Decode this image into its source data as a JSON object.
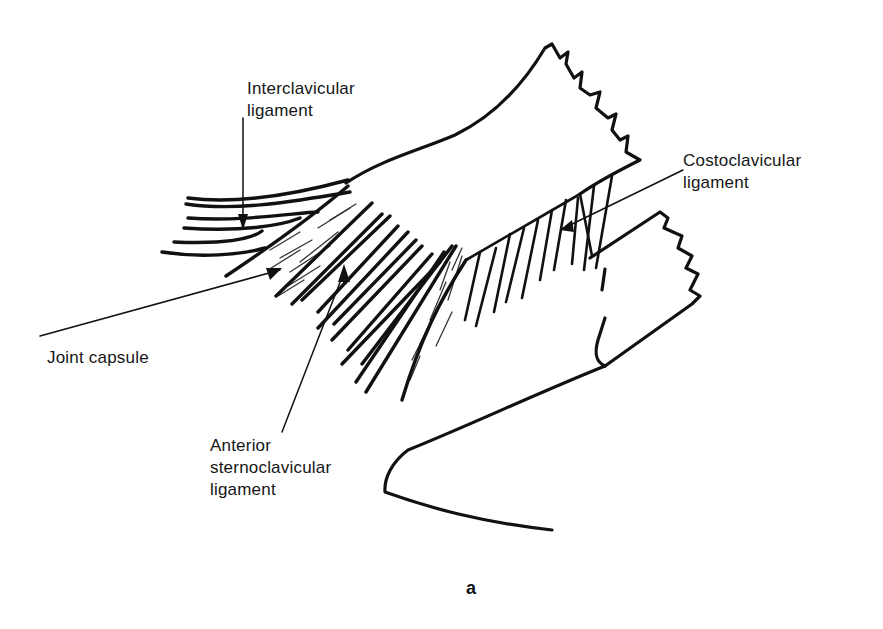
{
  "figure": {
    "panel_letter": "a",
    "colors": {
      "ink": "#111111",
      "background": "#ffffff"
    }
  },
  "labels": {
    "interclavicular": {
      "line1": "Interclavicular",
      "line2": "ligament"
    },
    "costoclavicular": {
      "line1": "Costoclavicular",
      "line2": "ligament"
    },
    "joint_capsule": {
      "line1": "Joint capsule"
    },
    "anterior_sternoclavicular": {
      "line1": "Anterior",
      "line2": "sternoclavicular",
      "line3": "ligament"
    }
  }
}
